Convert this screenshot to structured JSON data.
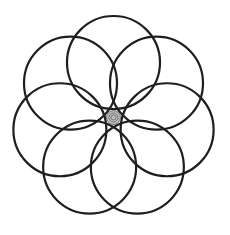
{
  "diagram": {
    "background": "#ffffff",
    "stroke_color": "#1e1e1e",
    "stroke_width": 2.2,
    "center": {
      "x": 113.5,
      "y": 117.5
    },
    "circle_count": 7,
    "circle_radius": 46.5,
    "orbit_radius": 55,
    "start_angle_deg": -90,
    "center_ornament": {
      "type": "heptagram-spiral",
      "radius": 7,
      "fill": "#bdbdbd",
      "stroke": "#555555"
    }
  }
}
